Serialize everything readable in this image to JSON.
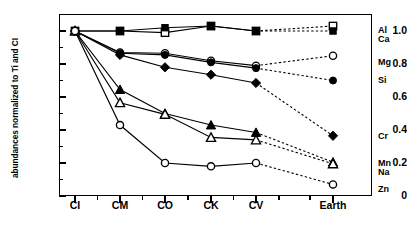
{
  "chart_data": {
    "type": "line",
    "title": "",
    "xlabel": "",
    "ylabel": "abundances normalized to Ti and CI",
    "categories": [
      "CI",
      "CM",
      "CO",
      "CK",
      "CV",
      "Earth"
    ],
    "ylim": [
      0,
      1.1
    ],
    "yticks": [
      0,
      0.2,
      0.4,
      0.6,
      0.8,
      1.0
    ],
    "ytick_labels": [
      "0",
      "0.2",
      "0.4",
      "0.6",
      "0.8",
      "1.0"
    ],
    "grid": false,
    "legend_position": "right",
    "note": "Solid line segments connect CI..CV; dotted segments connect CV to Earth.",
    "series": [
      {
        "name": "Al",
        "marker": "open-square",
        "values": [
          1.0,
          1.0,
          0.99,
          1.03,
          1.0,
          1.03
        ]
      },
      {
        "name": "Ca",
        "marker": "filled-square",
        "values": [
          1.0,
          1.0,
          1.02,
          1.03,
          1.0,
          1.0
        ]
      },
      {
        "name": "Mg",
        "marker": "open-circle",
        "values": [
          1.0,
          0.87,
          0.865,
          0.82,
          0.79,
          0.85
        ]
      },
      {
        "name": "Si",
        "marker": "filled-circle",
        "values": [
          1.0,
          0.865,
          0.855,
          0.81,
          0.775,
          0.7
        ]
      },
      {
        "name": "Cr",
        "marker": "filled-diamond",
        "values": [
          1.0,
          0.855,
          0.78,
          0.735,
          0.685,
          0.365
        ]
      },
      {
        "name": "Mn",
        "marker": "filled-triangle",
        "values": [
          1.0,
          0.645,
          0.5,
          0.43,
          0.385,
          0.205
        ]
      },
      {
        "name": "Na",
        "marker": "open-triangle",
        "values": [
          1.0,
          0.565,
          0.495,
          0.355,
          0.34,
          0.195
        ]
      },
      {
        "name": "Zn",
        "marker": "open-circle",
        "values": [
          1.0,
          0.43,
          0.2,
          0.18,
          0.2,
          0.07
        ]
      }
    ]
  },
  "axis": {
    "y_title": "abundances normalized to Ti and CI",
    "y_ticks": [
      "1.0",
      "0.8",
      "0.6",
      "0.4",
      "0.2",
      "0"
    ],
    "x_ticks": [
      "CI",
      "CM",
      "CO",
      "CK",
      "CV",
      "Earth"
    ]
  },
  "legend": {
    "entries": [
      {
        "label": "Al",
        "marker": "open-square"
      },
      {
        "label": "Ca",
        "marker": "filled-square"
      },
      {
        "label": "Mg",
        "marker": "open-circle"
      },
      {
        "label": "Si",
        "marker": "filled-circle"
      },
      {
        "label": "Cr",
        "marker": "filled-diamond"
      },
      {
        "label": "Mn",
        "marker": "filled-triangle"
      },
      {
        "label": "Na",
        "marker": "open-triangle"
      },
      {
        "label": "Zn",
        "marker": "open-circle"
      }
    ]
  }
}
